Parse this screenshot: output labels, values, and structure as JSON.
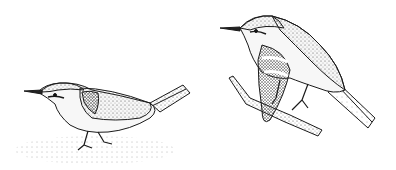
{
  "image": {
    "description": "Stippled pen-and-ink illustration of two small songbirds (warblers)",
    "background": "#ffffff",
    "ink": "#1a1a1a",
    "subjects": [
      {
        "name": "crouching-bird",
        "pose": "crouching on ground, facing left, tail raised"
      },
      {
        "name": "perched-bird",
        "pose": "perched on branch, facing left, head turned"
      }
    ]
  }
}
